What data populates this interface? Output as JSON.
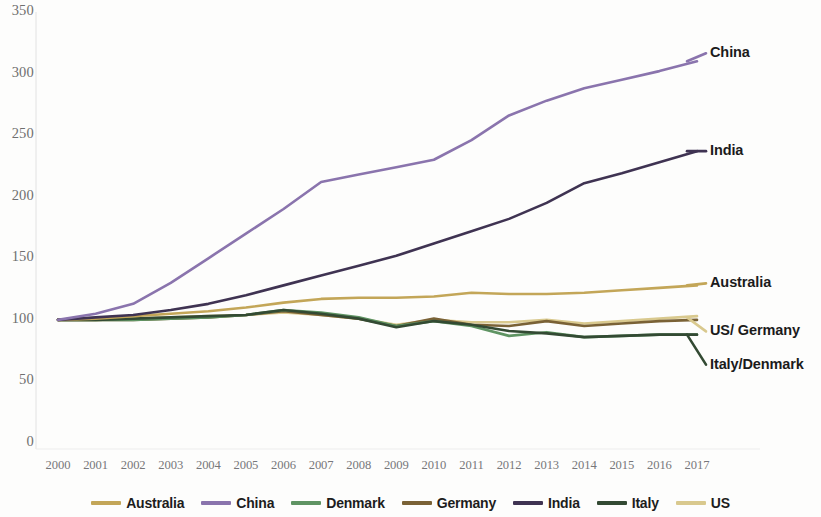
{
  "chart_data": {
    "type": "line",
    "title": "",
    "subtitle": "",
    "xlabel": "",
    "ylabel": "",
    "x": [
      2000,
      2001,
      2002,
      2003,
      2004,
      2005,
      2006,
      2007,
      2008,
      2009,
      2010,
      2011,
      2012,
      2013,
      2014,
      2015,
      2016,
      2017
    ],
    "xlim": [
      2000,
      2017
    ],
    "ylim": [
      0,
      350
    ],
    "yticks": [
      0,
      50,
      100,
      150,
      200,
      250,
      300,
      350
    ],
    "xticks": [
      "2000",
      "2001",
      "2002",
      "2003",
      "2004",
      "2005",
      "2006",
      "2007",
      "2008",
      "2009",
      "2010",
      "2011",
      "2012",
      "2013",
      "2014",
      "2015",
      "2016",
      "2017"
    ],
    "grid": false,
    "legend_position": "bottom",
    "series": [
      {
        "name": "Australia",
        "color": "#c3a658",
        "values": [
          100,
          101,
          103,
          105,
          107,
          110,
          114,
          117,
          118,
          118,
          119,
          122,
          121,
          121,
          122,
          124,
          126,
          128
        ]
      },
      {
        "name": "China",
        "color": "#8a74ad",
        "values": [
          100,
          105,
          113,
          130,
          150,
          170,
          190,
          212,
          218,
          224,
          230,
          246,
          266,
          278,
          288,
          295,
          302,
          310
        ]
      },
      {
        "name": "Denmark",
        "color": "#5f9463",
        "values": [
          100,
          100,
          100,
          101,
          102,
          104,
          108,
          106,
          102,
          95,
          99,
          95,
          87,
          90,
          86,
          87,
          88,
          88
        ]
      },
      {
        "name": "Germany",
        "color": "#7a6236",
        "values": [
          100,
          100,
          100,
          101,
          102,
          104,
          107,
          104,
          101,
          95,
          101,
          96,
          95,
          99,
          95,
          97,
          99,
          100
        ]
      },
      {
        "name": "India",
        "color": "#3f3352",
        "values": [
          100,
          102,
          104,
          108,
          113,
          120,
          128,
          136,
          144,
          152,
          162,
          172,
          182,
          195,
          211,
          219,
          228,
          237
        ]
      },
      {
        "name": "Italy",
        "color": "#334a33",
        "values": [
          100,
          100,
          101,
          102,
          103,
          104,
          108,
          105,
          101,
          94,
          99,
          96,
          91,
          89,
          86,
          87,
          88,
          88
        ]
      },
      {
        "name": "US",
        "color": "#d9c98e",
        "values": [
          100,
          100,
          101,
          102,
          103,
          104,
          106,
          104,
          101,
          96,
          100,
          98,
          98,
          100,
          97,
          99,
          101,
          103
        ]
      }
    ],
    "annotations": [
      {
        "text": "China",
        "x": 2017,
        "y": 310
      },
      {
        "text": "India",
        "x": 2017,
        "y": 237
      },
      {
        "text": "Australia",
        "x": 2017,
        "y": 128
      },
      {
        "text": "US/ Germany",
        "x": 2017,
        "y": 102
      },
      {
        "text": "Italy/Denmark",
        "x": 2017,
        "y": 88
      }
    ]
  },
  "legend": {
    "items": [
      {
        "label": "Australia",
        "color": "#c3a658"
      },
      {
        "label": "China",
        "color": "#8a74ad"
      },
      {
        "label": "Denmark",
        "color": "#5f9463"
      },
      {
        "label": "Germany",
        "color": "#7a6236"
      },
      {
        "label": "India",
        "color": "#3f3352"
      },
      {
        "label": "Italy",
        "color": "#334a33"
      },
      {
        "label": "US",
        "color": "#d9c98e"
      }
    ]
  }
}
